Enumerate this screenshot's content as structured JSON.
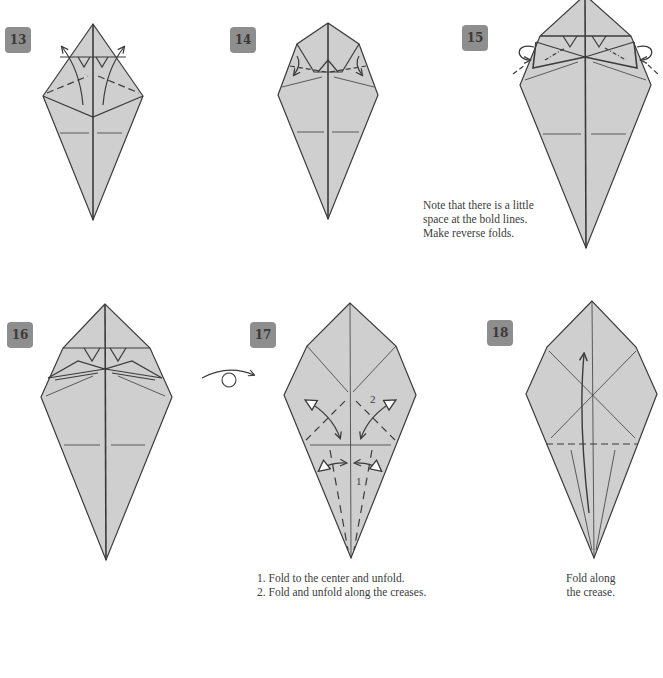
{
  "page": {
    "type": "origami-instructions",
    "paper_fill": "#cfcfcf",
    "line_color": "#3b3b3b",
    "badge_color": "#8e8e8e"
  },
  "steps": [
    {
      "number": "13",
      "badge": {
        "x": 5,
        "y": 27
      },
      "caption": []
    },
    {
      "number": "14",
      "badge": {
        "x": 230,
        "y": 27
      },
      "caption": []
    },
    {
      "number": "15",
      "badge": {
        "x": 462,
        "y": 25
      },
      "caption": [
        "Note that there is a little",
        "space at the bold lines.",
        "Make reverse folds."
      ]
    },
    {
      "number": "16",
      "badge": {
        "x": 7,
        "y": 322
      },
      "caption": []
    },
    {
      "number": "17",
      "badge": {
        "x": 250,
        "y": 322
      },
      "caption": [
        "1. Fold to the center and unfold.",
        "2. Fold and unfold along the creases."
      ],
      "labels": [
        "1",
        "2"
      ]
    },
    {
      "number": "18",
      "badge": {
        "x": 487,
        "y": 320
      },
      "caption": [
        "Fold along",
        "the crease."
      ]
    }
  ],
  "symbols": {
    "turn_over": "turn-over-arrow"
  }
}
